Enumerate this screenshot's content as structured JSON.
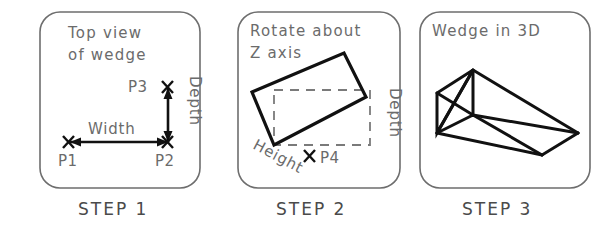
{
  "figure": {
    "background_color": "#ffffff",
    "ink_color": "#111111",
    "guide_color": "#6e6e6e"
  },
  "panels": [
    {
      "id": "step-1",
      "title_line_1": "Top  view",
      "title_line_2": "of  wedge",
      "step_label": "STEP  1",
      "points": [
        {
          "name": "P1",
          "label": "P1"
        },
        {
          "name": "P2",
          "label": "P2"
        },
        {
          "name": "P3",
          "label": "P3"
        }
      ],
      "dimensions": [
        {
          "name": "width",
          "label": "Width",
          "orientation": "horizontal"
        },
        {
          "name": "depth",
          "label": "Depth",
          "orientation": "vertical"
        }
      ]
    },
    {
      "id": "step-2",
      "title_line_1": "Rotate  about",
      "title_line_2": "Z  axis",
      "step_label": "STEP  2",
      "points": [
        {
          "name": "P4",
          "label": "P4"
        }
      ],
      "dimensions": [
        {
          "name": "height",
          "label": "Height",
          "orientation": "diagonal"
        },
        {
          "name": "depth",
          "label": "Depth",
          "orientation": "vertical"
        }
      ]
    },
    {
      "id": "step-3",
      "title_line_1": "Wedge  in  3D",
      "title_line_2": "",
      "step_label": "STEP  3",
      "points": [],
      "dimensions": []
    }
  ]
}
